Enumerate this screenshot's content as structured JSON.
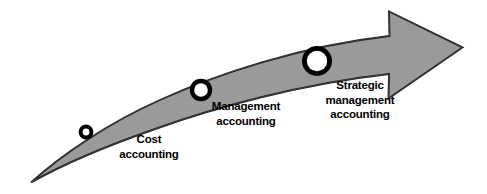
{
  "diagram": {
    "type": "curved-arrow-progression",
    "background_color": "#ffffff",
    "arrow": {
      "name": "upward-curving-arrow",
      "fill_color": "#9a9a9a",
      "stroke_color": "#1a1a1a",
      "direction": "lower-left to upper-right",
      "tail_point": "sharp taper",
      "head": "large solid arrowhead with barbs"
    },
    "markers": [
      {
        "name": "stage-marker-small",
        "ring_color": "#000000",
        "center_color": "#ffffff",
        "size": "small",
        "cx": 86,
        "cy": 132,
        "r_outer": 7.4,
        "r_inner": 3.4
      },
      {
        "name": "stage-marker-medium",
        "ring_color": "#000000",
        "center_color": "#ffffff",
        "size": "medium",
        "cx": 201,
        "cy": 90,
        "r_outer": 11.2,
        "r_inner": 6.8
      },
      {
        "name": "stage-marker-large",
        "ring_color": "#000000",
        "center_color": "#ffffff",
        "size": "large",
        "cx": 317,
        "cy": 61,
        "r_outer": 15.0,
        "r_inner": 10.2
      }
    ],
    "stages": [
      {
        "id": "cost-accounting",
        "order": 1,
        "lines": [
          "Cost",
          "accounting"
        ],
        "line1": "Cost",
        "line2": "accounting",
        "line3": ""
      },
      {
        "id": "management-accounting",
        "order": 2,
        "lines": [
          "Management",
          "accounting"
        ],
        "line1": "Management",
        "line2": "accounting",
        "line3": ""
      },
      {
        "id": "strategic-management-accounting",
        "order": 3,
        "lines": [
          "Strategic",
          "management",
          "accounting"
        ],
        "line1": "Strategic",
        "line2": "management",
        "line3": "accounting"
      }
    ]
  }
}
